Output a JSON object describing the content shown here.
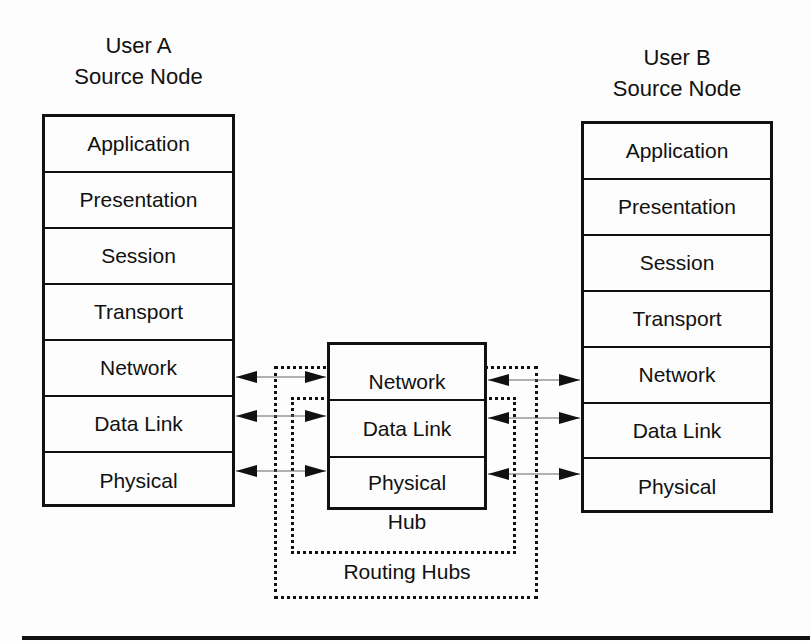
{
  "user_a": {
    "title_line1": "User A",
    "title_line2": "Source Node",
    "layers": [
      "Application",
      "Presentation",
      "Session",
      "Transport",
      "Network",
      "Data Link",
      "Physical"
    ]
  },
  "user_b": {
    "title_line1": "User B",
    "title_line2": "Source Node",
    "layers": [
      "Application",
      "Presentation",
      "Session",
      "Transport",
      "Network",
      "Data Link",
      "Physical"
    ]
  },
  "hub_stack": {
    "layers": [
      "Network",
      "Data Link",
      "Physical"
    ]
  },
  "labels": {
    "hub": "Hub",
    "routing_hubs": "Routing Hubs"
  },
  "colors": {
    "line": "#111111",
    "background": "#fdfdfd"
  }
}
